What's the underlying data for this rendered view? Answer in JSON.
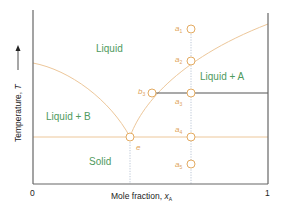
{
  "diagram": {
    "colors": {
      "axis": "#666666",
      "curve": "#edc79a",
      "tie_line": "#555555",
      "guide_line": "#a9b8cc",
      "region_label": "#4f9a5e",
      "point_label": "#e0a45a",
      "marker_stroke": "#e3ab62"
    },
    "axes": {
      "y_label": "Temperature, ",
      "y_label_var": "T",
      "y_arrow": "→",
      "x_label": "Mole fraction, ",
      "x_label_var": "x",
      "x_label_sub": "A",
      "x_ticks": [
        "0",
        "1"
      ]
    },
    "regions": {
      "liquid": "Liquid",
      "liquid_a": "Liquid + A",
      "liquid_b": "Liquid + B",
      "solid": "Solid"
    },
    "points": {
      "a1": {
        "letter": "a",
        "sub": "1"
      },
      "a2": {
        "letter": "a",
        "sub": "2"
      },
      "a3": {
        "letter": "a",
        "sub": "3"
      },
      "a4": {
        "letter": "a",
        "sub": "4"
      },
      "a5": {
        "letter": "a",
        "sub": "5"
      },
      "b3": {
        "letter": "b",
        "sub": "3"
      },
      "e": {
        "letter": "e"
      }
    }
  }
}
